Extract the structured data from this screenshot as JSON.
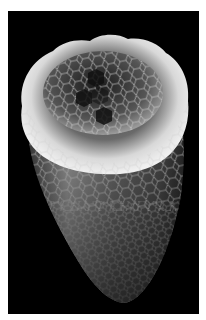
{
  "image": {
    "subject": "carbon nanotube with hexagonal lattice",
    "background_color": "#000000",
    "border_color": "#ffffff",
    "tube_highlight": "#e8e8e8",
    "tube_mid": "#8a8a8a",
    "tube_shadow": "#2a2a2a"
  }
}
